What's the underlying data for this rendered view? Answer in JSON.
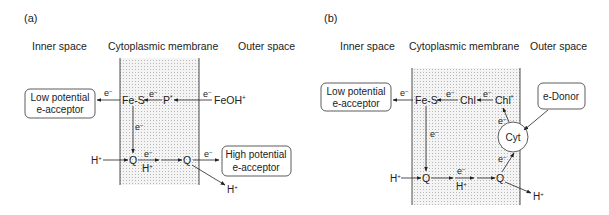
{
  "panel_a": {
    "label": "(a)",
    "headers": {
      "inner": "Inner space",
      "membrane": "Cytoplasmic membrane",
      "outer": "Outer space"
    },
    "low_box": {
      "line1": "Low potential",
      "line2": "e-acceptor"
    },
    "high_box": {
      "line1": "High potential",
      "line2": "e-acceptor"
    },
    "nodes": {
      "fes": "Fe-S",
      "p": "P",
      "p_sup": "*",
      "feoh": "FeOH",
      "feoh_sup": "+",
      "q1": "Q",
      "q2": "Q"
    },
    "electron": "e",
    "electron_sup": "−",
    "proton": "H",
    "proton_sup": "+"
  },
  "panel_b": {
    "label": "(b)",
    "headers": {
      "inner": "Inner space",
      "membrane": "Cytoplasmic membrane",
      "outer": "Outer space"
    },
    "low_box": {
      "line1": "Low potential",
      "line2": "e-acceptor"
    },
    "donor_box": "e-Donor",
    "nodes": {
      "fes": "Fe-S",
      "chl": "Chl",
      "chl_star": "Chl",
      "chl_star_sup": "*",
      "cyt": "Cyt",
      "q1": "Q",
      "q2": "Q"
    },
    "electron": "e",
    "electron_sup": "−",
    "proton": "H",
    "proton_sup": "+"
  },
  "colors": {
    "line": "#222222",
    "membrane_fill": "#f2f2f2",
    "membrane_dot": "#bbbbbb"
  }
}
